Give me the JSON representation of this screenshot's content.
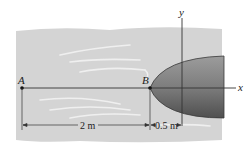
{
  "diagram": {
    "points": {
      "A": "A",
      "B": "B"
    },
    "axes": {
      "x": "x",
      "y": "y"
    },
    "dimensions": {
      "AB": "2 m",
      "B_to_origin": "0.5 m"
    },
    "colors": {
      "background_fluid": "#d6d6d6",
      "body_fill": "#8a8a8a",
      "body_dark": "#5e5e5e",
      "line": "#333333"
    }
  }
}
